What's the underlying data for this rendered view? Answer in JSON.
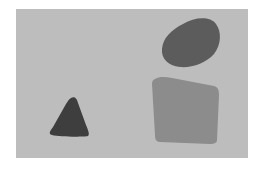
{
  "scene": {
    "background_color": "#ffffff",
    "panel": {
      "color": "#bdbdbd",
      "x": 16,
      "y": 9,
      "width": 232,
      "height": 149
    },
    "shapes": [
      {
        "name": "ellipse",
        "color": "#5c5c5c",
        "path": "M183,24 C195,17 210,16 216,24 C222,32 221,45 214,54 C206,63 192,68 180,67 C168,66 161,58 162,49 C163,38 171,30 183,24 Z"
      },
      {
        "name": "quadrilateral",
        "color": "#8c8c8c",
        "path": "M155,79 C160,76 166,77 172,78 L214,86 C218,87 219,90 219,95 L217,140 C217,143 214,144 210,144 L160,142 C156,142 155,139 155,135 L152,84 C152,81 153,80 155,79 Z"
      },
      {
        "name": "triangle",
        "color": "#3e3e3e",
        "path": "M71,98 C75,96 77,99 78,103 L86,125 C88,130 90,134 88,136 C84,137 60,137 52,135 C48,134 50,131 53,127 L66,104 C68,101 69,99 71,98 Z"
      }
    ]
  }
}
